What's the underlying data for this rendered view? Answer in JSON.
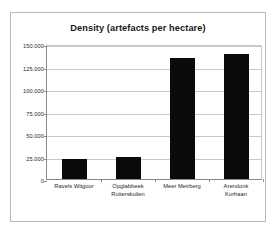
{
  "chart_data": {
    "type": "bar",
    "title": "Density (artefacts per hectare)",
    "xlabel": "",
    "ylabel": "",
    "categories": [
      "Ravels Witgoor",
      "Opglabbeek Ruiterskuilen",
      "Meer Meirberg",
      "Arendonk Korhaan"
    ],
    "category_lines": [
      [
        "Ravels Witgoor"
      ],
      [
        "Opglabbeek",
        "Ruiterskuilen"
      ],
      [
        "Meer Meirberg"
      ],
      [
        "Arendonk",
        "Korhaan"
      ]
    ],
    "values": [
      22000,
      24000,
      135000,
      139000
    ],
    "ylim": [
      0,
      150000
    ],
    "ytick_values": [
      0,
      25000,
      50000,
      75000,
      100000,
      125000,
      150000
    ],
    "ytick_labels": [
      "0",
      "25.000",
      "50.000",
      "75.000",
      "100.000",
      "125.000",
      "150.000"
    ],
    "grid": true,
    "legend": false,
    "bar_color": "#0a0a0a",
    "gridline_color": "#c9c9c9",
    "axis_color": "#8a8a8a",
    "plot_background": "#ffffff",
    "border_color": "#b9b9b9"
  },
  "caption": {
    "partial_text": ""
  }
}
